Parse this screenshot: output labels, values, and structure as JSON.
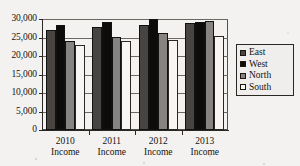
{
  "chart_data": {
    "type": "bar",
    "title": "",
    "xlabel": "",
    "ylabel": "",
    "categories": [
      "2010 Income",
      "2011 Income",
      "2012 Income",
      "2013 Income"
    ],
    "category_lines": [
      [
        "2010",
        "Income"
      ],
      [
        "2011",
        "Income"
      ],
      [
        "2012",
        "Income"
      ],
      [
        "2013",
        "Income"
      ]
    ],
    "series": [
      {
        "name": "East",
        "color": "#474442",
        "values": [
          27000,
          27800,
          28400,
          28800
        ]
      },
      {
        "name": "West",
        "color": "#0d0c0b",
        "values": [
          28500,
          29200,
          30200,
          29300
        ]
      },
      {
        "name": "North",
        "color": "#878380",
        "values": [
          24000,
          25100,
          26200,
          29400
        ]
      },
      {
        "name": "South",
        "color": "#f7f6f4",
        "values": [
          23000,
          24000,
          24400,
          25300
        ]
      }
    ],
    "ylim": [
      0,
      30000
    ],
    "ytick_values": [
      0,
      5000,
      10000,
      15000,
      20000,
      25000,
      30000
    ],
    "ytick_labels": [
      "0",
      "5,000",
      "10,000",
      "15,000",
      "20,000",
      "25,000",
      "30,000"
    ],
    "grid": true,
    "grid_axis": "y",
    "legend_position": "right",
    "legend_entries": [
      "East",
      "West",
      "North",
      "South"
    ]
  }
}
